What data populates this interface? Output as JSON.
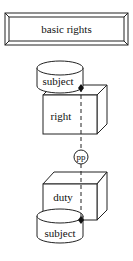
{
  "diagram": {
    "title_box": {
      "label": "basic rights"
    },
    "top_subject": {
      "label": "subject"
    },
    "right_box": {
      "label": "right"
    },
    "connector": {
      "label": "pp"
    },
    "duty_box": {
      "label": "duty"
    },
    "bottom_subject": {
      "label": "subject"
    }
  },
  "colors": {
    "stroke": "#222222",
    "background": "#ffffff"
  }
}
